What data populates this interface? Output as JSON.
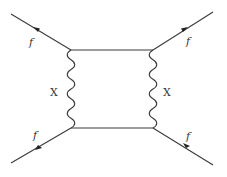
{
  "diagram": {
    "type": "feynman-box-diagram",
    "vertices": [
      {
        "id": "top-left",
        "x": 71,
        "y": 50
      },
      {
        "id": "top-right",
        "x": 153,
        "y": 50
      },
      {
        "id": "bottom-left",
        "x": 71,
        "y": 128
      },
      {
        "id": "bottom-right",
        "x": 153,
        "y": 128
      }
    ],
    "external_lines": [
      {
        "id": "fermion-top-left",
        "label": "f",
        "from": [
          11,
          14
        ],
        "to": [
          71,
          50
        ],
        "arrow": "toward-outside"
      },
      {
        "id": "fermion-top-right",
        "label": "f",
        "from": [
          213,
          12
        ],
        "to": [
          153,
          50
        ],
        "arrow": "toward-vertex"
      },
      {
        "id": "fermion-bottom-left",
        "label": "f",
        "from": [
          71,
          128
        ],
        "to": [
          11,
          163
        ],
        "arrow": "toward-outside"
      },
      {
        "id": "fermion-bottom-right",
        "label": "f",
        "from": [
          213,
          165
        ],
        "to": [
          153,
          128
        ],
        "arrow": "toward-vertex"
      }
    ],
    "internal_lines": [
      {
        "id": "fermion-top",
        "type": "straight",
        "from": "top-left",
        "to": "top-right"
      },
      {
        "id": "fermion-bottom",
        "type": "straight",
        "from": "bottom-left",
        "to": "bottom-right"
      },
      {
        "id": "boson-left",
        "type": "wavy",
        "label": "X",
        "from": "top-left",
        "to": "bottom-left"
      },
      {
        "id": "boson-right",
        "type": "wavy",
        "label": "X",
        "from": "top-right",
        "to": "bottom-right"
      }
    ],
    "labels": {
      "f_top_left": "f",
      "f_top_right": "f",
      "f_bottom_left": "f",
      "f_bottom_right": "f",
      "x_left": "X",
      "x_right": "X"
    },
    "colors": {
      "line": "#3a3a3a",
      "background": "#ffffff"
    }
  }
}
